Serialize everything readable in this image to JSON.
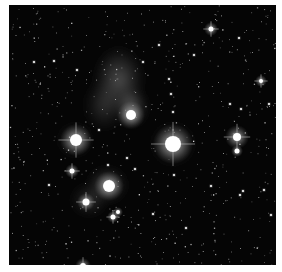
{
  "image": {
    "subject": "Pleiades star cluster (grayscale astrophotograph)",
    "frame": {
      "x": 9,
      "y": 5,
      "width": 267,
      "height": 260
    },
    "background_color": "#ffffff",
    "sky_color": "#050505"
  },
  "nebulae": [
    {
      "cx": 110,
      "cy": 75,
      "rx": 28,
      "ry": 38,
      "opacity": 0.38
    },
    {
      "cx": 122,
      "cy": 102,
      "rx": 18,
      "ry": 22,
      "opacity": 0.45
    },
    {
      "cx": 95,
      "cy": 100,
      "rx": 22,
      "ry": 30,
      "opacity": 0.22
    },
    {
      "cx": 98,
      "cy": 180,
      "rx": 22,
      "ry": 20,
      "opacity": 0.35
    },
    {
      "cx": 80,
      "cy": 195,
      "rx": 20,
      "ry": 18,
      "opacity": 0.22
    },
    {
      "cx": 66,
      "cy": 135,
      "rx": 18,
      "ry": 18,
      "opacity": 0.25
    },
    {
      "cx": 164,
      "cy": 139,
      "rx": 24,
      "ry": 24,
      "opacity": 0.25
    }
  ],
  "bright_stars": [
    {
      "name": "alcyone",
      "cx": 164,
      "cy": 139,
      "core": 8,
      "halo": 20,
      "spikes": true
    },
    {
      "name": "merope",
      "cx": 122,
      "cy": 110,
      "core": 5,
      "halo": 14,
      "spikes": false
    },
    {
      "name": "electra",
      "cx": 67,
      "cy": 135,
      "core": 6,
      "halo": 16,
      "spikes": true
    },
    {
      "name": "maia",
      "cx": 100,
      "cy": 181,
      "core": 6,
      "halo": 15,
      "spikes": false
    },
    {
      "name": "atlas",
      "cx": 228,
      "cy": 132,
      "core": 4,
      "halo": 12,
      "spikes": true
    },
    {
      "name": "pleione",
      "cx": 228,
      "cy": 146,
      "core": 2.5,
      "halo": 6,
      "spikes": false
    },
    {
      "name": "taygeta",
      "cx": 77,
      "cy": 197,
      "core": 3.5,
      "halo": 9,
      "spikes": true
    },
    {
      "name": "celaeno",
      "cx": 63,
      "cy": 166,
      "core": 2.5,
      "halo": 7,
      "spikes": true
    },
    {
      "name": "asterope-a",
      "cx": 104,
      "cy": 212,
      "core": 2.5,
      "halo": 6,
      "spikes": true
    },
    {
      "name": "asterope-b",
      "cx": 109,
      "cy": 207,
      "core": 2,
      "halo": 5,
      "spikes": false
    },
    {
      "name": "bottom-star",
      "cx": 74,
      "cy": 261,
      "core": 3,
      "halo": 8,
      "spikes": true
    },
    {
      "name": "top-right-star",
      "cx": 202,
      "cy": 24,
      "core": 2.5,
      "halo": 7,
      "spikes": true
    },
    {
      "name": "right-star",
      "cx": 252,
      "cy": 76,
      "core": 2,
      "halo": 6,
      "spikes": true
    }
  ],
  "medium_stars": [
    [
      134,
      57
    ],
    [
      160,
      74
    ],
    [
      162,
      89
    ],
    [
      164,
      107
    ],
    [
      221,
      99
    ],
    [
      260,
      99
    ],
    [
      232,
      104
    ],
    [
      118,
      153
    ],
    [
      126,
      164
    ],
    [
      165,
      170
    ],
    [
      202,
      181
    ],
    [
      231,
      190
    ],
    [
      234,
      186
    ],
    [
      144,
      209
    ],
    [
      25,
      57
    ],
    [
      40,
      180
    ],
    [
      177,
      223
    ],
    [
      262,
      210
    ],
    [
      255,
      185
    ],
    [
      45,
      56
    ],
    [
      68,
      65
    ],
    [
      150,
      40
    ],
    [
      230,
      33
    ],
    [
      185,
      50
    ],
    [
      90,
      125
    ],
    [
      99,
      160
    ]
  ],
  "field_star_seed": 1337,
  "field_star_count": 650
}
